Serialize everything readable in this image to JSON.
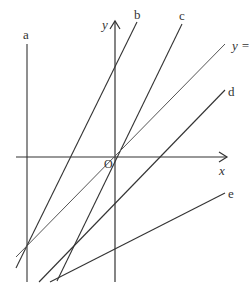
{
  "diagram": {
    "type": "coordinate-plane-lines",
    "colors": {
      "line": "#333333",
      "axis": "#333333",
      "background": "#ffffff"
    },
    "axes": {
      "x_label": "x",
      "y_label": "y",
      "origin_label": "O"
    },
    "lines": [
      {
        "label": "a",
        "kind": "vertical"
      },
      {
        "label": "b",
        "kind": "steep-positive-slope"
      },
      {
        "label": "c",
        "kind": "steep-positive-slope-through-origin"
      },
      {
        "label": "y =",
        "kind": "identity-line-through-origin"
      },
      {
        "label": "d",
        "kind": "positive-slope-below-identity"
      },
      {
        "label": "e",
        "kind": "shallow-positive-slope"
      }
    ]
  }
}
